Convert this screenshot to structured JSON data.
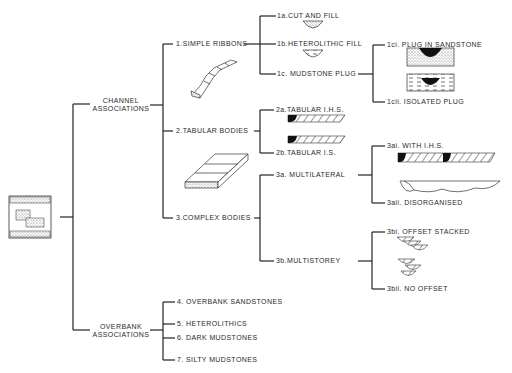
{
  "root": {
    "label": "channel-belt-overview-icon"
  },
  "groups": [
    {
      "id": "channel",
      "label_line1": "CHANNEL",
      "label_line2": "ASSOCIATIONS"
    },
    {
      "id": "overbank",
      "label_line1": "OVERBANK",
      "label_line2": "ASSOCIATIONS"
    }
  ],
  "channel_types": [
    {
      "label": "1.SIMPLE RIBBONS"
    },
    {
      "label": "2.TABULAR BODIES"
    },
    {
      "label": "3.COMPLEX BODIES"
    }
  ],
  "simple_ribbons": [
    {
      "label": "1a.CUT AND FILL"
    },
    {
      "label": "1b.HETEROLITHIC FILL"
    },
    {
      "label": "1c. MUDSTONE PLUG"
    }
  ],
  "mudstone_plug": [
    {
      "label": "1ci. PLUG IN SANDSTONE"
    },
    {
      "label": "1cii. ISOLATED PLUG"
    }
  ],
  "tabular_bodies": [
    {
      "label": "2a.TABULAR I.H.S."
    },
    {
      "label": "2b.TABULAR I.S."
    }
  ],
  "complex_bodies": [
    {
      "label": "3a. MULTILATERAL"
    },
    {
      "label": "3b.MULTISTOREY"
    }
  ],
  "multilateral": [
    {
      "label": "3ai. WITH I.H.S."
    },
    {
      "label": "3aii. DISORGANISED"
    }
  ],
  "multistorey": [
    {
      "label": "3bi. OFFSET STACKED"
    },
    {
      "label": "3bii. NO OFFSET"
    }
  ],
  "overbank": [
    {
      "label": "4. OVERBANK SANDSTONES"
    },
    {
      "label": "5. HETEROLITHICS"
    },
    {
      "label": "6. DARK MUDSTONES"
    },
    {
      "label": "7. SILTY MUDSTONES"
    }
  ]
}
